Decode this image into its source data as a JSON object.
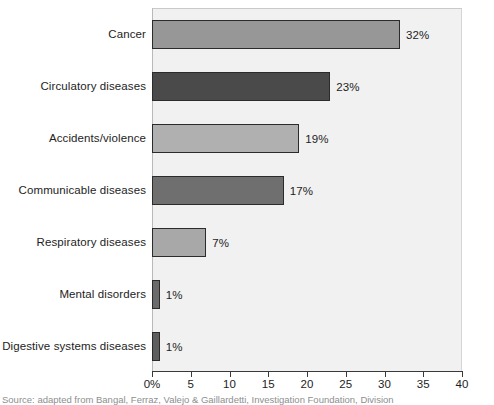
{
  "chart_data": {
    "type": "bar",
    "orientation": "horizontal",
    "title": "",
    "xlabel": "",
    "ylabel": "",
    "categories": [
      "Cancer",
      "Circulatory diseases",
      "Accidents/violence",
      "Communicable diseases",
      "Respiratory diseases",
      "Mental disorders",
      "Digestive systems diseases"
    ],
    "values": [
      32,
      23,
      19,
      17,
      7,
      1,
      1
    ],
    "value_labels": [
      "32%",
      "23%",
      "19%",
      "17%",
      "7%",
      "1%",
      "1%"
    ],
    "bar_colors": [
      "#979797",
      "#4a4a4a",
      "#b0b0b0",
      "#6f6f6f",
      "#a8a8a8",
      "#6b6b6b",
      "#5e5e5e"
    ],
    "bar_border_color": "#2b2b2b",
    "plot_background": "#f1f1f1",
    "xlim": [
      0,
      40
    ],
    "xticks": [
      0,
      5,
      10,
      15,
      20,
      25,
      30,
      35,
      40
    ],
    "xtick_labels": [
      "0%",
      "5",
      "10",
      "15",
      "20",
      "25",
      "30",
      "35",
      "40"
    ],
    "grid": false,
    "legend": null
  },
  "caption": {
    "text": "Source: adapted from Bangal, Ferraz, Valejo & Gaillardetti, Investigation Foundation, Division"
  }
}
